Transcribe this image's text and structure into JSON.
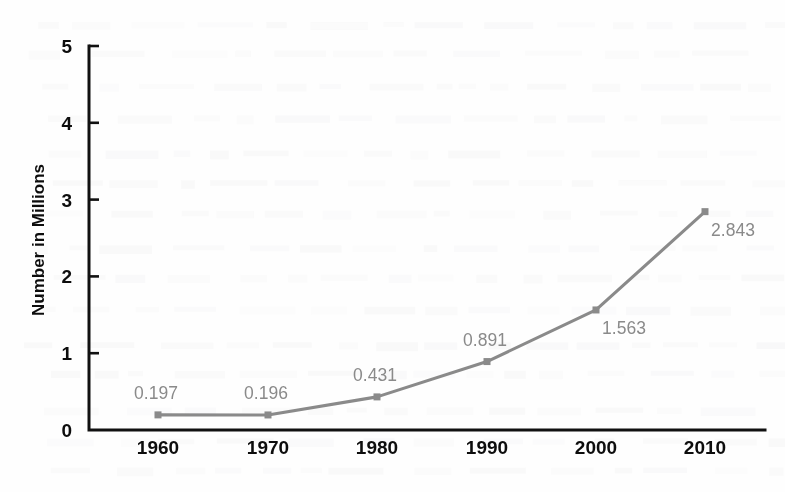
{
  "chart_data": {
    "type": "line",
    "title": "",
    "subtitle": "",
    "xlabel": "",
    "ylabel": "Number in Millions",
    "categories": [
      "1960",
      "1970",
      "1980",
      "1990",
      "2000",
      "2010"
    ],
    "values": [
      0.197,
      0.196,
      0.431,
      0.891,
      1.563,
      2.843
    ],
    "point_labels": [
      "0.197",
      "0.196",
      "0.431",
      "0.891",
      "1.563",
      "2.843"
    ],
    "label_positions": [
      "above-left",
      "above-left",
      "above-left",
      "above-left",
      "below-right",
      "below-right"
    ],
    "ylim": [
      0,
      5
    ],
    "ytick_labels": [
      "0",
      "1",
      "2",
      "3",
      "4",
      "5"
    ],
    "ytick_values": [
      0,
      1,
      2,
      3,
      4,
      5
    ],
    "xtick_labels": [
      "1960",
      "1970",
      "1980",
      "1990",
      "2000",
      "2010"
    ],
    "grid": false,
    "legend": false,
    "legend_position": "none",
    "series": [
      {
        "name": "Number in Millions",
        "values": [
          0.197,
          0.196,
          0.431,
          0.891,
          1.563,
          2.843
        ]
      }
    ],
    "colors": {
      "series_line": "#8a8a8a",
      "marker": "#8a8a8a",
      "point_label": "#8a8a8a",
      "axis": "#111111",
      "axis_text": "#0d0d0d",
      "background": "#fefefe"
    }
  }
}
